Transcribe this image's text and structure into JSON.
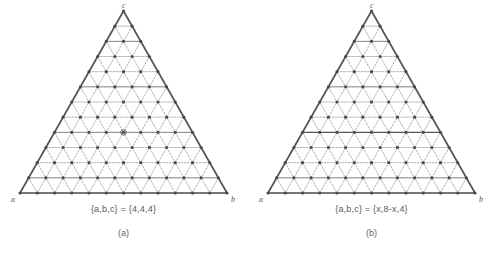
{
  "figure": {
    "background_color": "#ffffff",
    "ink_color": "#555555",
    "node_color": "#4a4a4a",
    "grid_color": "#8a8a8a",
    "panels": [
      {
        "id": "a",
        "panel_label": "(a)",
        "caption": "{a,b,c} = {4,4,4}",
        "vertex_labels": {
          "bottom_left": "a",
          "bottom_right": "b",
          "apex": "c"
        },
        "lattice": {
          "type": "triangular",
          "order": 12,
          "nodes_per_edge": 13,
          "total_nodes": 91
        },
        "highlight": {
          "kind": "node",
          "description": "single emphasized lattice node near the centroid",
          "row": 8,
          "col": 4
        }
      },
      {
        "id": "b",
        "panel_label": "(b)",
        "caption": "{a,b,c} = {x,8-x,4}",
        "vertex_labels": {
          "bottom_left": "a",
          "bottom_right": "b",
          "apex": "c"
        },
        "lattice": {
          "type": "triangular",
          "order": 12,
          "nodes_per_edge": 13,
          "total_nodes": 91
        },
        "highlight": {
          "kind": "row",
          "description": "emphasized horizontal lattice row",
          "row": 8
        }
      }
    ]
  },
  "chart_data": {
    "type": "diagram",
    "title": "",
    "subtitle": "",
    "panels": [
      {
        "label": "(a)",
        "caption": "{a,b,c} = {4,4,4}",
        "lattice_order": 12,
        "nodes_per_edge": 13,
        "vertices": [
          "a",
          "b",
          "c"
        ],
        "highlight_type": "node"
      },
      {
        "label": "(b)",
        "caption": "{a,b,c} = {x,8-x,4}",
        "lattice_order": 12,
        "nodes_per_edge": 13,
        "vertices": [
          "a",
          "b",
          "c"
        ],
        "highlight_type": "row"
      }
    ]
  }
}
